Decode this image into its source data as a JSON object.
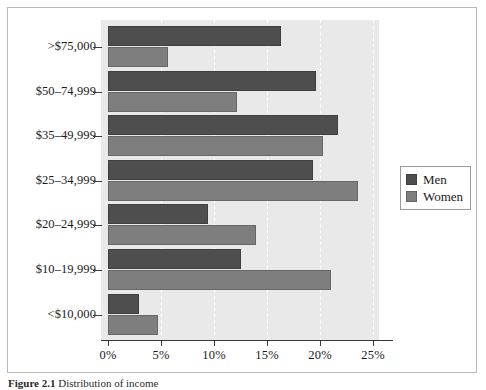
{
  "figure": {
    "caption_number": "Figure 2.1",
    "caption_text": "Distribution of income"
  },
  "legend": {
    "position": "right",
    "items": [
      {
        "label": "Men",
        "color": "#4e4e4e"
      },
      {
        "label": "Women",
        "color": "#7e7e7e"
      }
    ]
  },
  "chart_data": {
    "type": "bar",
    "orientation": "horizontal",
    "title": "",
    "xlabel": "",
    "ylabel": "",
    "xlim": [
      0,
      27.5
    ],
    "xticks": [
      0,
      5,
      10,
      15,
      20,
      25
    ],
    "xtick_labels": [
      "0%",
      "5%",
      "10%",
      "15%",
      "20%",
      "25%"
    ],
    "grid": "vertical-dashed-white",
    "categories": [
      ">$75,000",
      "$50–74,999",
      "$35–49,999",
      "$25–34,999",
      "$20–24,999",
      "$10–19,999",
      "<$10,000"
    ],
    "series": [
      {
        "name": "Men",
        "color": "#4e4e4e",
        "values": [
          16.3,
          19.6,
          21.7,
          19.3,
          9.4,
          12.5,
          2.9
        ]
      },
      {
        "name": "Women",
        "color": "#7e7e7e",
        "values": [
          5.7,
          12.2,
          20.3,
          23.6,
          14.0,
          21.0,
          4.7
        ]
      }
    ]
  }
}
